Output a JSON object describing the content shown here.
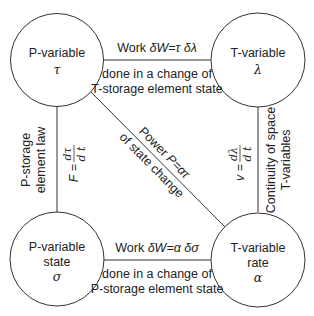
{
  "nodes": {
    "top_left": {
      "label": "P-variable",
      "symbol": "τ"
    },
    "top_right": {
      "label": "T-variable",
      "symbol": "λ"
    },
    "bottom_left": {
      "label": "P-variable",
      "sublabel": "state",
      "symbol": "σ"
    },
    "bottom_right": {
      "label": "T-variable",
      "sublabel": "rate",
      "symbol": "α"
    }
  },
  "edges": {
    "top": {
      "above_prefix": "Work ",
      "above_formula": "δW=τ δλ",
      "below_line1": "done in a change of",
      "below_line2": "T-storage element state"
    },
    "bottom": {
      "above_prefix": "Work ",
      "above_formula": "δW=α δσ",
      "below_line1": "done in a change of",
      "below_line2": "P-storage element state"
    },
    "left": {
      "text_line1": "P-storage",
      "text_line2": "element law",
      "formula_lhs": "F =",
      "formula_num": "dτ",
      "formula_den": "d t"
    },
    "right": {
      "formula_lhs": "v =",
      "formula_num": "dλ",
      "formula_den": "d t",
      "text_line1": "Continuity of space",
      "text_line2": "T-variables"
    },
    "diagonal": {
      "above_prefix": "Power ",
      "above_formula": "P=ατ",
      "below": "of state change"
    }
  },
  "colors": {
    "line": "#333333",
    "text": "#222222",
    "background": "#ffffff"
  }
}
